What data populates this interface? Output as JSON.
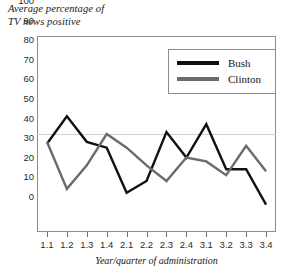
{
  "chart_data": {
    "type": "line",
    "title": "Average percentage of\nTV news positive",
    "xlabel": "Year/quarter of administration",
    "ylabel": "",
    "categories": [
      "1.1",
      "1.2",
      "1.3",
      "1.4",
      "2.1",
      "2.2",
      "2.3",
      "2.4",
      "3.1",
      "3.2",
      "3.3",
      "3.4"
    ],
    "series": [
      {
        "name": "Bush",
        "color": "#111111",
        "values": [
          45,
          59,
          46,
          43,
          20,
          26,
          51,
          38,
          55,
          32,
          32,
          14
        ]
      },
      {
        "name": "Clinton",
        "color": "#6b6b6b",
        "values": [
          46,
          22,
          34,
          50,
          43,
          34,
          26,
          38,
          36,
          29,
          44,
          31
        ]
      }
    ],
    "ylim": [
      0,
      100
    ],
    "y_ticks": [
      0,
      10,
      20,
      30,
      40,
      50,
      60,
      70,
      80,
      90,
      100
    ],
    "y_tick_labels": [
      "0",
      "10",
      "20",
      "30",
      "40",
      "50",
      "60",
      "70",
      "80",
      "90",
      "100"
    ],
    "grid": false,
    "reference_line": {
      "value": 50,
      "color": "#d0d0d0"
    },
    "legend_position": "top-right",
    "frame_color": "#8c8c8c",
    "background": "#ffffff"
  }
}
